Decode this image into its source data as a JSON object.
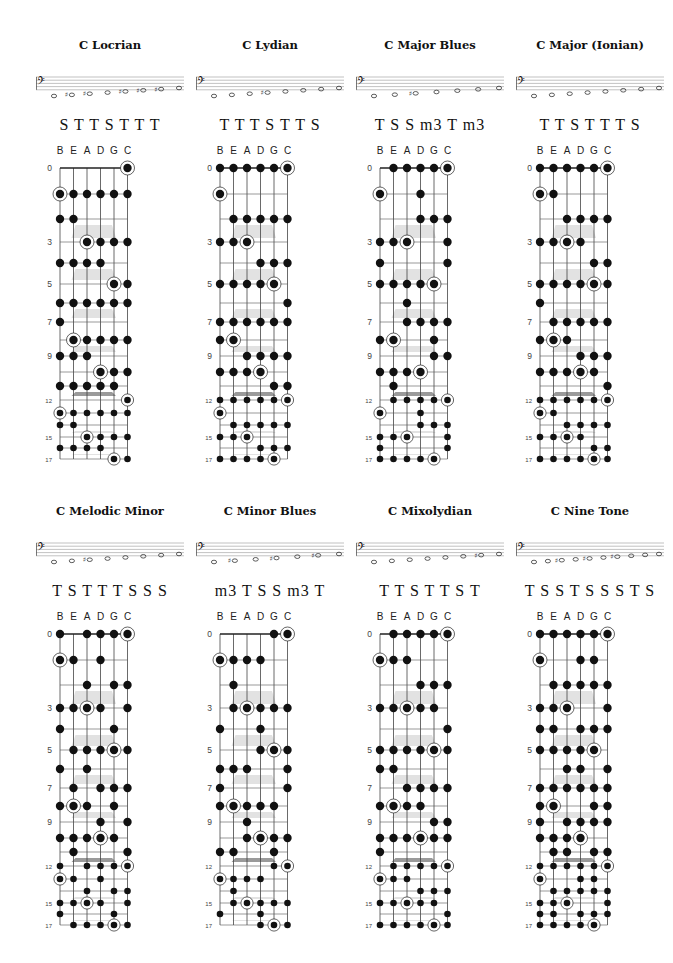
{
  "document": {
    "strings": [
      "B",
      "E",
      "A",
      "D",
      "G",
      "C"
    ],
    "string_pitch_classes": [
      11,
      4,
      9,
      2,
      7,
      0
    ],
    "tonic_pitch_class": 0,
    "fret_count": 17,
    "fret_labels": {
      "0": "0",
      "3": "3",
      "5": "5",
      "7": "7",
      "9": "9",
      "12": "12",
      "15": "15",
      "17": "17"
    },
    "inlay_frets": [
      3,
      5,
      7,
      9,
      12,
      15,
      17
    ],
    "double_inlay_fret": 12
  },
  "scales": [
    {
      "title": "C Locrian",
      "steps": "S T T S T T T",
      "pitch_classes": [
        0,
        1,
        3,
        5,
        6,
        8,
        10
      ],
      "staff_notes": [
        "C",
        "D♭",
        "E♭",
        "F",
        "G♭",
        "A♭",
        "B♭",
        "C"
      ]
    },
    {
      "title": "C Lydian",
      "steps": "T T T S T T S",
      "pitch_classes": [
        0,
        2,
        4,
        6,
        7,
        9,
        11
      ],
      "staff_notes": [
        "C",
        "D",
        "E",
        "F♯",
        "G",
        "A",
        "B",
        "C"
      ]
    },
    {
      "title": "C Major Blues",
      "steps": "T S S m3 T m3",
      "pitch_classes": [
        0,
        2,
        3,
        4,
        7,
        9
      ],
      "staff_notes": [
        "C",
        "D",
        "E♭",
        "E",
        "G",
        "A",
        "C"
      ]
    },
    {
      "title": "C Major (Ionian)",
      "steps": "T T S T T T S",
      "pitch_classes": [
        0,
        2,
        4,
        5,
        7,
        9,
        11
      ],
      "staff_notes": [
        "C",
        "D",
        "E",
        "F",
        "G",
        "A",
        "B",
        "C"
      ]
    },
    {
      "title": "C Melodic Minor",
      "steps": "T S T T T S S S",
      "pitch_classes": [
        0,
        2,
        3,
        5,
        7,
        9,
        11
      ],
      "staff_notes": [
        "C",
        "D",
        "E♭",
        "F",
        "G",
        "A",
        "B",
        "C"
      ]
    },
    {
      "title": "C Minor Blues",
      "steps": "m3 T S S m3 T",
      "pitch_classes": [
        0,
        3,
        5,
        6,
        7,
        10
      ],
      "staff_notes": [
        "C",
        "E♭",
        "F",
        "G♭",
        "G",
        "B♭",
        "C"
      ]
    },
    {
      "title": "C Mixolydian",
      "steps": "T T S T T S T",
      "pitch_classes": [
        0,
        2,
        4,
        5,
        7,
        9,
        10
      ],
      "staff_notes": [
        "C",
        "D",
        "E",
        "F",
        "G",
        "A",
        "B♭",
        "C"
      ]
    },
    {
      "title": "C Nine Tone",
      "steps": "T S S T S S S T S",
      "pitch_classes": [
        0,
        2,
        3,
        4,
        6,
        7,
        8,
        9,
        11
      ],
      "staff_notes": [
        "C",
        "D",
        "E♭",
        "E",
        "F♯",
        "G",
        "A♭",
        "A",
        "B",
        "C"
      ]
    }
  ],
  "layout": {
    "panel_x": [
      30,
      190,
      350,
      510
    ],
    "panel_y": [
      38,
      504
    ]
  }
}
